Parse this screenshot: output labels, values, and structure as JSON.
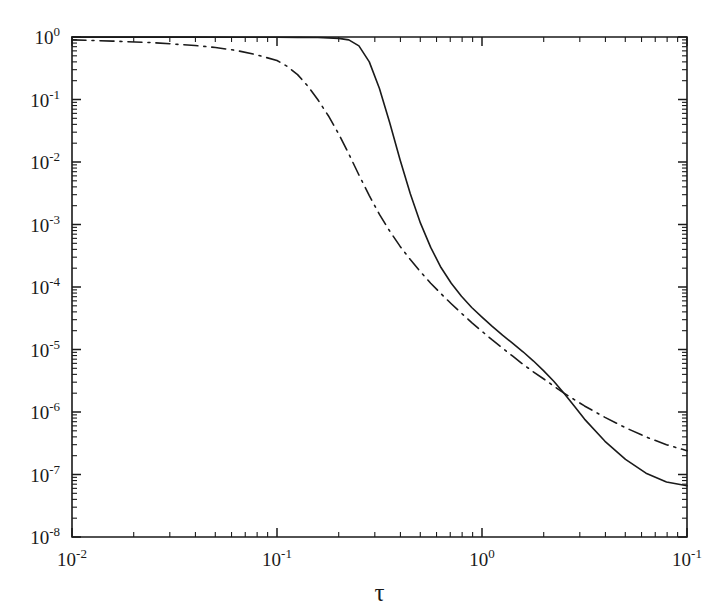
{
  "figure": {
    "background_color": "#ffffff",
    "line_color": "#1a1a1a",
    "axis_color": "#1a1a1a"
  },
  "chart_data": {
    "type": "line",
    "title": "",
    "subtitle": "",
    "xlabel": "τ",
    "ylabel": "",
    "xscale": "log",
    "yscale": "log",
    "xlim": [
      0.01,
      10
    ],
    "ylim": [
      1e-08,
      1
    ],
    "grid": false,
    "legend": null,
    "legend_position": "none",
    "x_tick_labels": [
      "10",
      "10",
      "10",
      "10"
    ],
    "x_tick_exponents": [
      "-2",
      "-1",
      "0",
      "-1"
    ],
    "x_tick_values": [
      0.01,
      0.1,
      1,
      10
    ],
    "y_tick_labels": [
      "10",
      "10",
      "10",
      "10",
      "10",
      "10",
      "10",
      "10",
      "10"
    ],
    "y_tick_exponents": [
      "0",
      "-1",
      "-2",
      "-3",
      "-4",
      "-5",
      "-6",
      "-7",
      "-8"
    ],
    "y_tick_values": [
      1,
      0.1,
      0.01,
      0.001,
      0.0001,
      1e-05,
      1e-06,
      1e-07,
      1e-08
    ],
    "annotations": [],
    "series": [
      {
        "name": "solid-curve",
        "style": "solid",
        "color": "#1a1a1a",
        "x": [
          0.01,
          0.0158,
          0.0251,
          0.0398,
          0.0631,
          0.1,
          0.126,
          0.158,
          0.178,
          0.2,
          0.224,
          0.251,
          0.282,
          0.316,
          0.355,
          0.398,
          0.447,
          0.501,
          0.562,
          0.631,
          0.708,
          0.794,
          0.891,
          1.0,
          1.122,
          1.259,
          1.413,
          1.585,
          1.778,
          1.995,
          2.239,
          2.512,
          2.818,
          3.162,
          3.981,
          5.012,
          6.31,
          7.943,
          10.0
        ],
        "y": [
          0.995,
          0.995,
          0.995,
          0.994,
          0.993,
          0.991,
          0.988,
          0.98,
          0.97,
          0.95,
          0.9,
          0.72,
          0.4,
          0.15,
          0.042,
          0.011,
          0.0031,
          0.00105,
          0.00043,
          0.000205,
          0.000115,
          7.1e-05,
          4.7e-05,
          3.3e-05,
          2.35e-05,
          1.7e-05,
          1.25e-05,
          9.2e-06,
          6.6e-06,
          4.6e-06,
          3.1e-06,
          2e-06,
          1.25e-06,
          7.7e-07,
          3.4e-07,
          1.75e-07,
          1.05e-07,
          7.6e-08,
          6.6e-08
        ]
      },
      {
        "name": "dash-dot-curve",
        "style": "dashdot",
        "color": "#1a1a1a",
        "x": [
          0.01,
          0.0158,
          0.0251,
          0.0398,
          0.0501,
          0.0631,
          0.0794,
          0.1,
          0.112,
          0.126,
          0.141,
          0.158,
          0.178,
          0.2,
          0.224,
          0.251,
          0.282,
          0.316,
          0.355,
          0.398,
          0.447,
          0.501,
          0.562,
          0.631,
          0.708,
          0.794,
          0.891,
          1.0,
          1.122,
          1.259,
          1.413,
          1.585,
          1.778,
          1.995,
          2.239,
          2.512,
          2.818,
          3.162,
          3.981,
          5.012,
          6.31,
          7.943,
          10.0
        ],
        "y": [
          0.9,
          0.86,
          0.81,
          0.73,
          0.68,
          0.61,
          0.52,
          0.42,
          0.34,
          0.25,
          0.165,
          0.1,
          0.055,
          0.028,
          0.0135,
          0.0062,
          0.0029,
          0.00145,
          0.00078,
          0.00045,
          0.000275,
          0.000175,
          0.000115,
          7.8e-05,
          5.4e-05,
          3.8e-05,
          2.7e-05,
          1.95e-05,
          1.42e-05,
          1.05e-05,
          7.8e-06,
          5.8e-06,
          4.4e-06,
          3.4e-06,
          2.6e-06,
          2e-06,
          1.58e-06,
          1.25e-06,
          8.2e-07,
          5.6e-07,
          4e-07,
          3e-07,
          2.4e-07
        ]
      }
    ]
  }
}
